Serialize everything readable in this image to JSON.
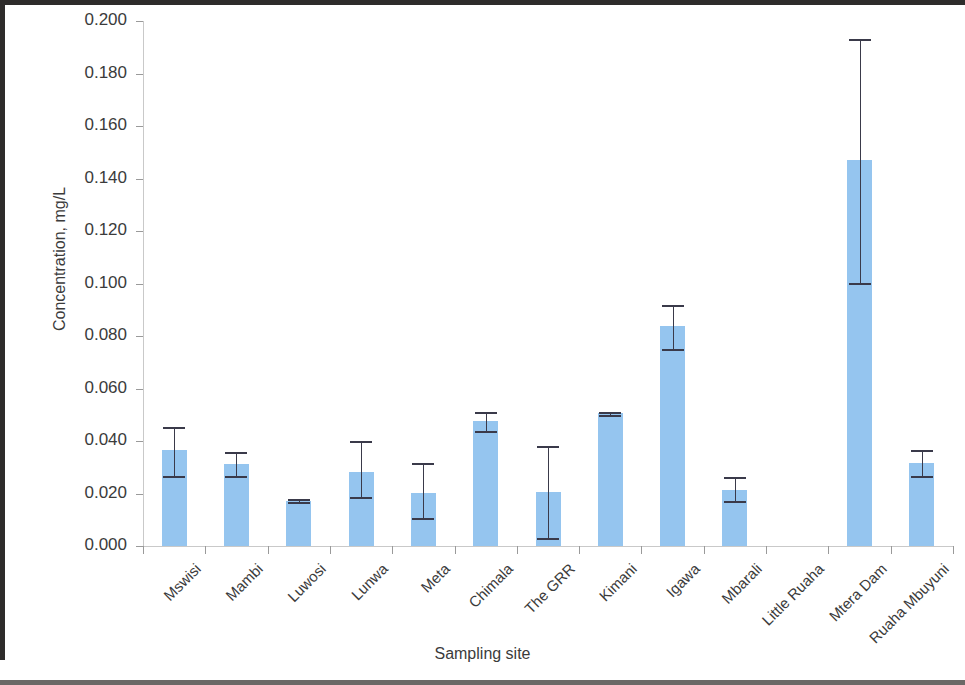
{
  "chart_data": {
    "type": "bar",
    "title": "",
    "xlabel": "Sampling site",
    "ylabel": "Concentration, mg/L",
    "ylim": [
      0.0,
      0.2
    ],
    "ytick_step": 0.02,
    "ytick_labels": [
      "0.200",
      "0.180",
      "0.160",
      "0.140",
      "0.120",
      "0.100",
      "0.080",
      "0.060",
      "0.040",
      "0.020",
      "0.000"
    ],
    "ytick_values": [
      0.2,
      0.18,
      0.16,
      0.14,
      0.12,
      0.1,
      0.08,
      0.06,
      0.04,
      0.02,
      0.0
    ],
    "grid": false,
    "legend": "none",
    "bar_color": "#95c5ef",
    "error_color": "#3a3a4a",
    "categories": [
      "Mswisi",
      "Mambi",
      "Luwosi",
      "Lunwa",
      "Meta",
      "Chimala",
      "The GRR",
      "Kimani",
      "Igawa",
      "Mbarali",
      "Little Ruaha",
      "Mtera Dam",
      "Ruaha Mbuyuni"
    ],
    "values": [
      0.0365,
      0.0312,
      0.0172,
      0.0282,
      0.0203,
      0.0475,
      0.0205,
      0.0505,
      0.0838,
      0.0215,
      0.0,
      0.147,
      0.0315
    ],
    "error_upper": [
      0.0455,
      0.036,
      0.0178,
      0.04,
      0.0315,
      0.051,
      0.038,
      0.0512,
      0.092,
      0.0262,
      0.0,
      0.193,
      0.0365
    ],
    "error_lower": [
      0.0268,
      0.0265,
      0.0166,
      0.0188,
      0.0105,
      0.044,
      0.003,
      0.0498,
      0.0752,
      0.017,
      0.0,
      0.1002,
      0.0268
    ]
  }
}
